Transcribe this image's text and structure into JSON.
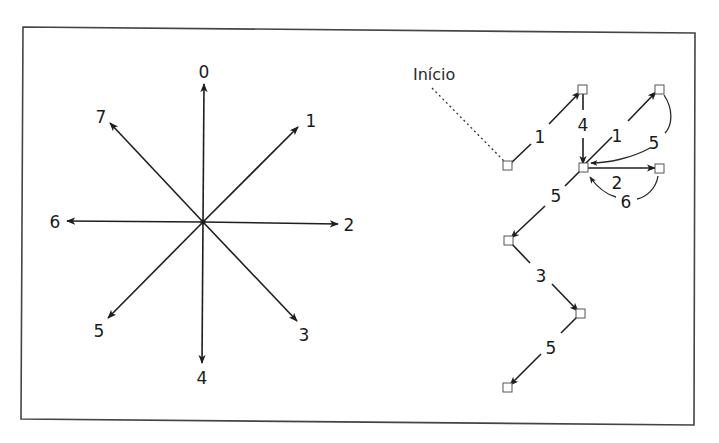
{
  "figure": {
    "frame_color": "#444444",
    "ink_color": "#1e1e1e"
  },
  "compass": {
    "center": [
      203,
      222
    ],
    "directions": [
      {
        "code": "0",
        "label": "0"
      },
      {
        "code": "1",
        "label": "1"
      },
      {
        "code": "2",
        "label": "2"
      },
      {
        "code": "3",
        "label": "3"
      },
      {
        "code": "4",
        "label": "4"
      },
      {
        "code": "5",
        "label": "5"
      },
      {
        "code": "6",
        "label": "6"
      },
      {
        "code": "7",
        "label": "7"
      }
    ]
  },
  "path": {
    "start_label": "Início",
    "segments": [
      {
        "code": "1",
        "label": "1"
      },
      {
        "code": "4",
        "label": "4"
      },
      {
        "code": "1",
        "label": "1"
      },
      {
        "code": "5",
        "label": "5"
      },
      {
        "code": "2",
        "label": "2"
      },
      {
        "code": "6",
        "label": "6"
      },
      {
        "code": "5",
        "label": "5"
      },
      {
        "code": "3",
        "label": "3"
      },
      {
        "code": "5",
        "label": "5"
      }
    ],
    "chain_code": "1 4 1 5 2 6 5 3 5"
  }
}
